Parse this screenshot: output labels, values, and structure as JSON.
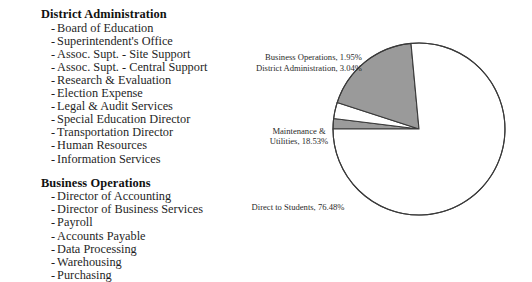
{
  "org_chart": {
    "groups": [
      {
        "heading": "District Administration",
        "items": [
          "Board of Education",
          "Superintendent's Office",
          "Assoc. Supt. - Site Support",
          "Assoc. Supt. - Central Support",
          "Research & Evaluation",
          "Election Expense",
          "Legal & Audit Services",
          "Special Education Director",
          "Transportation Director",
          "Human Resources",
          "Information Services"
        ]
      },
      {
        "heading": "Business Operations",
        "items": [
          "Director of Accounting",
          "Director of Business Services",
          "Payroll",
          "Accounts Payable",
          "Data Processing",
          "Warehousing",
          "Purchasing"
        ]
      }
    ],
    "bullet": "-"
  },
  "labels": {
    "business_operations": "Business Operations, 1.95%",
    "district_administration": "District Administration, 3.04%",
    "maintenance_line1": "Maintenance &",
    "maintenance_line2": "Utilities, 18.53%",
    "direct_to_students": "Direct to Students, 76.48%"
  },
  "chart_data": {
    "type": "pie",
    "title": "",
    "categories": [
      "Business Operations",
      "District Administration",
      "Maintenance & Utilities",
      "Direct to Students"
    ],
    "values": [
      1.95,
      3.04,
      18.53,
      76.48
    ],
    "value_labels": [
      "1.95%",
      "3.04%",
      "18.53%",
      "76.48%"
    ],
    "unit": "%",
    "slice_colors": [
      "#9b9b9b",
      "#ffffff",
      "#9a9a9a",
      "#ffffff"
    ],
    "outline_color": "#3a3a3a",
    "legend": "none",
    "start_angle_deg": 180,
    "direction": "clockwise",
    "geometry": {
      "cx": 209,
      "cy": 129,
      "r": 86
    }
  }
}
